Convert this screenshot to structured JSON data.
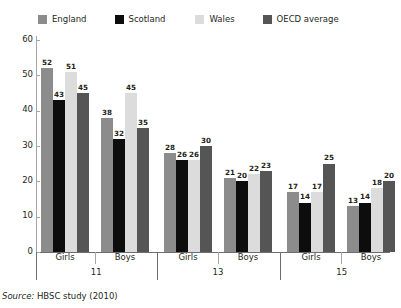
{
  "legend": {
    "items": [
      {
        "label": "England",
        "color": "#8c8c8c"
      },
      {
        "label": "Scotland",
        "color": "#0d0d0d"
      },
      {
        "label": "Wales",
        "color": "#dcdcdc"
      },
      {
        "label": "OECD average",
        "color": "#555555"
      }
    ]
  },
  "source": {
    "lead": "Source:",
    "text": "HBSC study (2010)"
  },
  "axis": {
    "yticks": [
      "0",
      "10",
      "20",
      "30",
      "40",
      "50",
      "60"
    ],
    "ages": [
      "11",
      "13",
      "15"
    ],
    "sexes": [
      "Girls",
      "Boys"
    ]
  },
  "chart_data": {
    "type": "bar",
    "title": "",
    "xlabel": "",
    "ylabel": "",
    "ylim": [
      0,
      60
    ],
    "ytick_step": 10,
    "grid": false,
    "legend_position": "top",
    "categories": [
      "Girls 11",
      "Boys 11",
      "Girls 13",
      "Boys 13",
      "Girls 15",
      "Boys 15"
    ],
    "group_labels": [
      "Girls",
      "Boys",
      "Girls",
      "Boys",
      "Girls",
      "Boys"
    ],
    "age_groups": [
      "11",
      "13",
      "15"
    ],
    "series": [
      {
        "name": "England",
        "color": "#8c8c8c",
        "values": [
          52,
          38,
          28,
          21,
          17,
          13
        ]
      },
      {
        "name": "Scotland",
        "color": "#0d0d0d",
        "values": [
          43,
          32,
          26,
          20,
          14,
          14
        ]
      },
      {
        "name": "Wales",
        "color": "#dcdcdc",
        "values": [
          51,
          45,
          26,
          22,
          17,
          18
        ]
      },
      {
        "name": "OECD average",
        "color": "#555555",
        "values": [
          45,
          35,
          30,
          23,
          25,
          20
        ]
      }
    ]
  }
}
